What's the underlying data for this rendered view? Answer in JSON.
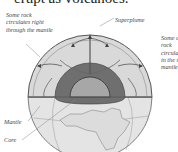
{
  "heading": "erupt as volcanoes.",
  "labels": {
    "left": "Some rock circulates right through the mantle",
    "superplume": "Superplume",
    "right": "Some of rock circulates in the upper mantle only",
    "mantle": "Mantle",
    "core": "Core"
  },
  "colors": {
    "mantle_fill": "#d6d6d6",
    "lower_mantle_fill": "#6e6e6e",
    "core_fill": "#a9a9a9",
    "globe_surface": "#e6e6e6",
    "outline": "#555555"
  }
}
